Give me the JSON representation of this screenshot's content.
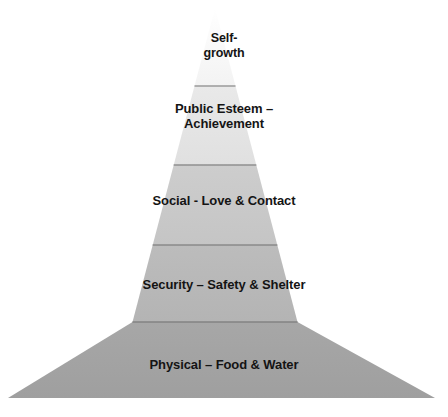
{
  "figure": {
    "type": "pyramid-diagram",
    "name": "Hierarchy of Needs Pyramid",
    "background_color": "#ffffff",
    "text_color": "#141414",
    "divider_color": "#8c8c8c",
    "apex": {
      "x": 215,
      "y": 8
    },
    "base": {
      "left_x": 8,
      "right_x": 435,
      "y": 398
    }
  },
  "tiers": [
    {
      "index": 1,
      "label": "Physical – Food & Water",
      "color": "#a3a3a3",
      "top_y": 322,
      "bottom_y": 398,
      "level_name": "physical"
    },
    {
      "index": 2,
      "label": "Security – Safety & Shelter",
      "color": "#b8b8b8",
      "top_y": 245,
      "bottom_y": 322,
      "level_name": "security"
    },
    {
      "index": 3,
      "label": "Social - Love & Contact",
      "color": "#c9c9c9",
      "top_y": 165,
      "bottom_y": 245,
      "level_name": "social"
    },
    {
      "index": 4,
      "label": "Public Esteem –\nAchievement",
      "color": "#e4e4e4",
      "top_y": 86,
      "bottom_y": 165,
      "level_name": "public-esteem"
    },
    {
      "index": 5,
      "label": "Self-\ngrowth",
      "color": "#fbfbfb",
      "top_y": 8,
      "bottom_y": 86,
      "level_name": "self-growth"
    }
  ]
}
